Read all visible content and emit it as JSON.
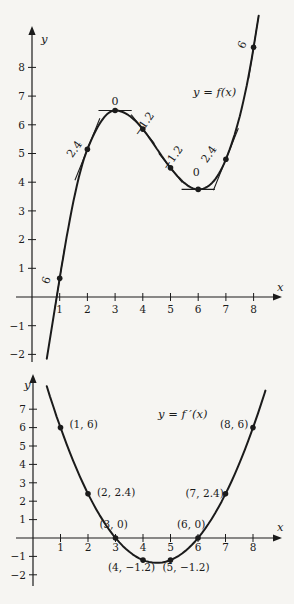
{
  "style": {
    "ink": "#1b1b1b",
    "paper": "#f6f5f2"
  },
  "chart_data": [
    {
      "type": "line",
      "id": "f",
      "title": "y = f(x)",
      "xlabel": "x",
      "ylabel": "y",
      "x_ticks": [
        1,
        2,
        3,
        4,
        5,
        6,
        7,
        8
      ],
      "y_ticks": [
        -2,
        -1,
        1,
        2,
        3,
        4,
        5,
        6,
        7,
        8
      ],
      "xlim": [
        0,
        9.2
      ],
      "ylim": [
        -2.6,
        9.9
      ],
      "grid": false,
      "legend": "none",
      "curve": {
        "kind": "hermite",
        "extend_left_to_y": -2.15,
        "extend_right_to_y": 9.8
      },
      "points": [
        {
          "x": 1,
          "y": 0.65,
          "slope": 6,
          "slope_label": "6",
          "tan_hw": 0.18,
          "label_dx": -10,
          "label_dy": 3,
          "label_rot": -70
        },
        {
          "x": 2,
          "y": 5.15,
          "slope": 2.4,
          "slope_label": "2.4",
          "tan_hw": 0.45,
          "label_dx": -10,
          "label_dy": 2,
          "label_rot": -55
        },
        {
          "x": 3,
          "y": 6.5,
          "slope": 0,
          "slope_label": "0",
          "tan_hw": 0.6,
          "label_dx": 0,
          "label_dy": -5,
          "label_rot": 0
        },
        {
          "x": 4,
          "y": 5.85,
          "slope": -1.2,
          "slope_label": "−1.2",
          "tan_hw": 0.42,
          "label_dx": 4,
          "label_dy": -3,
          "label_rot": -55
        },
        {
          "x": 5,
          "y": 4.5,
          "slope": -1.2,
          "slope_label": "−1.2",
          "tan_hw": 0.42,
          "label_dx": 5,
          "label_dy": -8,
          "label_rot": -55
        },
        {
          "x": 6,
          "y": 3.75,
          "slope": 0,
          "slope_label": "0",
          "tan_hw": 0.6,
          "label_dx": -2,
          "label_dy": -13,
          "label_rot": 0
        },
        {
          "x": 7,
          "y": 4.8,
          "slope": 2.4,
          "slope_label": "2.4",
          "tan_hw": 0.45,
          "label_dx": -14,
          "label_dy": -3,
          "label_rot": -55
        },
        {
          "x": 8,
          "y": 8.7,
          "slope": 6,
          "slope_label": "6",
          "tan_hw": 0.18,
          "label_dx": -8,
          "label_dy": -1,
          "label_rot": -65
        }
      ],
      "layout": {
        "x0": 32,
        "y0": 297,
        "ux": 27.7,
        "uy": 28.7,
        "y_axis_top": 26,
        "y_axis_bottom": 362,
        "x_axis_left": 16,
        "x_axis_right": 282,
        "title_x": 193,
        "title_y": 96,
        "xlabel_x": 277,
        "xlabel_y": 291,
        "ylabel_x": 41,
        "ylabel_y": 43,
        "x_tick_label_dy": 16,
        "y_tick_label_dx": -7
      }
    },
    {
      "type": "line",
      "id": "fprime",
      "title": "y = f ′(x)",
      "xlabel": "x",
      "ylabel": "y",
      "x_ticks": [
        1,
        2,
        3,
        4,
        5,
        6,
        7,
        8
      ],
      "y_ticks": [
        -2,
        -1,
        1,
        2,
        3,
        4,
        5,
        6,
        7
      ],
      "xlim": [
        0,
        9.2
      ],
      "ylim": [
        -2.8,
        8.9
      ],
      "grid": false,
      "legend": "none",
      "curve": {
        "kind": "quadratic",
        "roots": [
          3,
          6
        ],
        "coeff": 0.6,
        "x_range": [
          0.5,
          8.45
        ]
      },
      "points": [
        {
          "x": 1,
          "y": 6,
          "label": "(1, 6)",
          "label_dx": 9,
          "label_dy": 0
        },
        {
          "x": 2,
          "y": 2.4,
          "label": "(2, 2.4)",
          "label_dx": 9,
          "label_dy": 2
        },
        {
          "x": 3,
          "y": 0,
          "label": "(3, 0)",
          "label_dx": -16,
          "label_dy": -10
        },
        {
          "x": 4,
          "y": -1.2,
          "label": "(4, −1.2)",
          "label_dx": -35,
          "label_dy": 11
        },
        {
          "x": 5,
          "y": -1.2,
          "label": "(5, −1.2)",
          "label_dx": -8,
          "label_dy": 11
        },
        {
          "x": 6,
          "y": 0,
          "label": "(6, 0)",
          "label_dx": -21,
          "label_dy": -10
        },
        {
          "x": 7,
          "y": 2.4,
          "label": "(7, 2.4)",
          "label_dx": -40,
          "label_dy": 3
        },
        {
          "x": 8,
          "y": 6,
          "label": "(8, 6)",
          "label_dx": -33,
          "label_dy": 0
        }
      ],
      "layout": {
        "x0": 33,
        "y0": 538,
        "ux": 27.5,
        "uy": 18.4,
        "y_axis_top": 374,
        "y_axis_bottom": 586,
        "x_axis_left": 16,
        "x_axis_right": 282,
        "title_x": 158,
        "title_y": 418,
        "xlabel_x": 277,
        "xlabel_y": 531,
        "ylabel_x": 24,
        "ylabel_y": 389,
        "x_tick_label_dy": 13,
        "y_tick_label_dx": -7
      }
    }
  ]
}
